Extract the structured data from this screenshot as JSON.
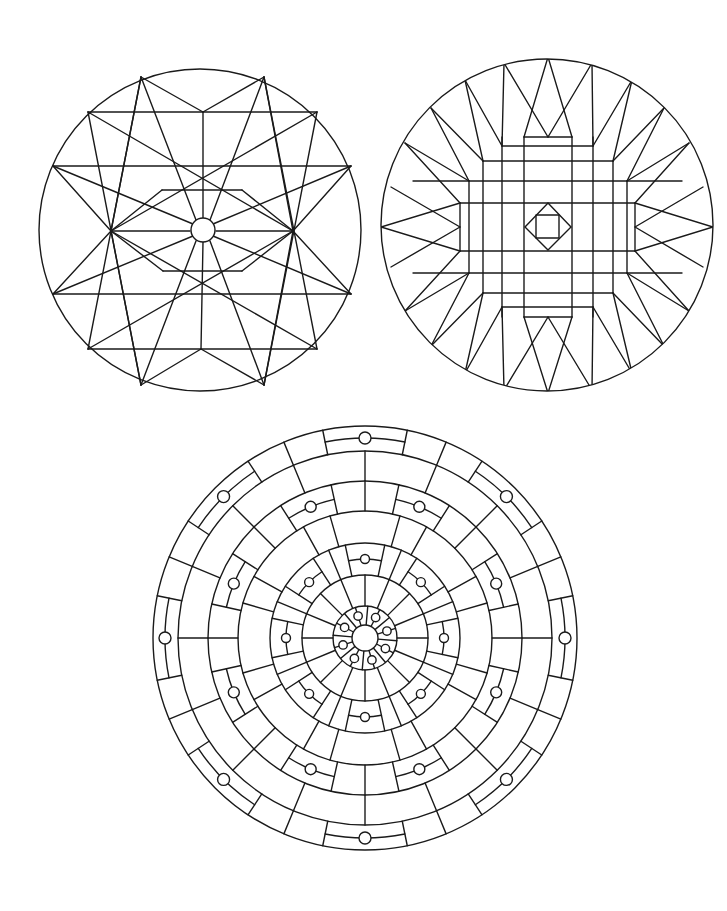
{
  "page": {
    "background": "#ffffff",
    "stroke_color": "#1a1a1a",
    "width": 727,
    "height": 911
  },
  "mandala_star": {
    "label": "star-mandala",
    "outer_circle": {
      "cx": 200,
      "cy": 230,
      "r": 161
    },
    "center_circle": {
      "cx": 203,
      "cy": 230,
      "r": 12
    },
    "lines": [
      [
        88,
        112,
        317,
        112
      ],
      [
        53,
        166,
        351,
        166
      ],
      [
        162,
        190,
        242,
        190
      ],
      [
        111,
        231,
        190,
        231
      ],
      [
        216,
        231,
        293,
        231
      ],
      [
        163,
        271,
        242,
        271
      ],
      [
        53,
        294,
        351,
        294
      ],
      [
        88,
        349,
        317,
        349
      ],
      [
        141,
        77,
        203,
        112
      ],
      [
        264,
        77,
        203,
        112
      ],
      [
        141,
        385,
        201,
        349
      ],
      [
        264,
        385,
        201,
        349
      ],
      [
        203,
        112,
        203,
        218
      ],
      [
        203,
        242,
        201,
        349
      ],
      [
        141,
        77,
        111,
        231
      ],
      [
        141,
        77,
        196,
        220
      ],
      [
        264,
        77,
        293,
        231
      ],
      [
        264,
        77,
        210,
        220
      ],
      [
        88,
        112,
        293,
        231
      ],
      [
        317,
        112,
        111,
        231
      ],
      [
        53,
        166,
        193,
        224
      ],
      [
        351,
        166,
        213,
        224
      ],
      [
        53,
        294,
        193,
        236
      ],
      [
        351,
        294,
        213,
        236
      ],
      [
        88,
        349,
        293,
        231
      ],
      [
        317,
        349,
        111,
        231
      ],
      [
        141,
        385,
        111,
        231
      ],
      [
        141,
        385,
        196,
        241
      ],
      [
        264,
        385,
        293,
        231
      ],
      [
        264,
        385,
        210,
        241
      ],
      [
        53,
        166,
        111,
        231
      ],
      [
        53,
        294,
        111,
        231
      ],
      [
        351,
        166,
        293,
        231
      ],
      [
        351,
        294,
        293,
        231
      ],
      [
        88,
        112,
        141,
        385
      ],
      [
        317,
        112,
        264,
        385
      ],
      [
        88,
        349,
        141,
        77
      ],
      [
        317,
        349,
        264,
        77
      ],
      [
        162,
        190,
        111,
        231
      ],
      [
        242,
        190,
        293,
        231
      ],
      [
        163,
        271,
        111,
        231
      ],
      [
        242,
        271,
        293,
        231
      ]
    ]
  },
  "mandala_grid": {
    "label": "grid-mandala",
    "outer_circle": {
      "cx": 547,
      "cy": 225,
      "r": 166
    },
    "diamond": [
      [
        548,
        203
      ],
      [
        571,
        227
      ],
      [
        548,
        250
      ],
      [
        525,
        227
      ]
    ],
    "inner_square": {
      "x": 536,
      "y": 215,
      "w": 23,
      "h": 23
    },
    "lines": [
      [
        502,
        137,
        502,
        317
      ],
      [
        524,
        137,
        524,
        317
      ],
      [
        572,
        137,
        572,
        317
      ],
      [
        593,
        137,
        593,
        317
      ],
      [
        483,
        161,
        483,
        293
      ],
      [
        613,
        161,
        613,
        293
      ],
      [
        469,
        181,
        469,
        273
      ],
      [
        627,
        181,
        627,
        273
      ],
      [
        460,
        203,
        460,
        251
      ],
      [
        635,
        203,
        635,
        251
      ],
      [
        524,
        137,
        572,
        137
      ],
      [
        502,
        146,
        593,
        146
      ],
      [
        483,
        161,
        613,
        161
      ],
      [
        413,
        181,
        682,
        181
      ],
      [
        460,
        203,
        635,
        203
      ],
      [
        460,
        251,
        635,
        251
      ],
      [
        413,
        273,
        682,
        273
      ],
      [
        483,
        293,
        613,
        293
      ],
      [
        502,
        307,
        593,
        307
      ],
      [
        524,
        317,
        572,
        317
      ],
      [
        548,
        57,
        524,
        137
      ],
      [
        548,
        57,
        572,
        137
      ],
      [
        504,
        63,
        548,
        137
      ],
      [
        592,
        63,
        548,
        137
      ],
      [
        504,
        63,
        502,
        146
      ],
      [
        592,
        63,
        593,
        146
      ],
      [
        465,
        80,
        502,
        146
      ],
      [
        632,
        80,
        593,
        146
      ],
      [
        465,
        80,
        483,
        161
      ],
      [
        632,
        80,
        613,
        161
      ],
      [
        431,
        108,
        483,
        161
      ],
      [
        664,
        108,
        613,
        161
      ],
      [
        431,
        108,
        469,
        181
      ],
      [
        664,
        108,
        627,
        181
      ],
      [
        405,
        143,
        469,
        181
      ],
      [
        689,
        143,
        627,
        181
      ],
      [
        405,
        143,
        460,
        203
      ],
      [
        689,
        143,
        635,
        203
      ],
      [
        381,
        227,
        460,
        203
      ],
      [
        713,
        227,
        635,
        203
      ],
      [
        381,
        227,
        460,
        251
      ],
      [
        713,
        227,
        635,
        251
      ],
      [
        391,
        187,
        460,
        227
      ],
      [
        703,
        187,
        635,
        227
      ],
      [
        391,
        267,
        460,
        227
      ],
      [
        703,
        267,
        635,
        227
      ],
      [
        405,
        311,
        460,
        251
      ],
      [
        689,
        311,
        635,
        251
      ],
      [
        405,
        311,
        469,
        273
      ],
      [
        689,
        311,
        627,
        273
      ],
      [
        431,
        346,
        469,
        273
      ],
      [
        664,
        346,
        627,
        273
      ],
      [
        431,
        346,
        483,
        293
      ],
      [
        664,
        346,
        613,
        293
      ],
      [
        465,
        373,
        483,
        293
      ],
      [
        632,
        373,
        613,
        293
      ],
      [
        465,
        373,
        502,
        307
      ],
      [
        632,
        373,
        593,
        307
      ],
      [
        504,
        390,
        502,
        307
      ],
      [
        592,
        390,
        593,
        307
      ],
      [
        504,
        390,
        548,
        317
      ],
      [
        592,
        390,
        548,
        317
      ],
      [
        548,
        393,
        524,
        317
      ],
      [
        548,
        393,
        572,
        317
      ]
    ]
  },
  "mandala_rings": {
    "label": "ring-mandala",
    "cx": 365,
    "cy": 638,
    "rings": [
      212,
      187,
      157,
      127,
      95,
      63,
      32
    ],
    "center_circle_r": 13,
    "bands": [
      {
        "name": "outer-band",
        "r_in": 187,
        "r_out": 212,
        "dividers_deg": [
          22.5,
          67.5,
          112.5,
          157.5,
          202.5,
          247.5,
          292.5,
          337.5
        ],
        "medallions": {
          "angles_deg": [
            0,
            45,
            90,
            135,
            180,
            225,
            270,
            315
          ],
          "half_width_deg": 11.5,
          "mid_r": 200,
          "dot_r": 6
        }
      },
      {
        "name": "band-2",
        "r_in": 157,
        "r_out": 187,
        "dividers_deg": [
          0,
          22.5,
          45,
          67.5,
          90,
          112.5,
          135,
          157.5,
          180,
          202.5,
          225,
          247.5,
          270,
          292.5,
          315,
          337.5
        ],
        "medallions": null
      },
      {
        "name": "band-3",
        "r_in": 127,
        "r_out": 157,
        "dividers_deg": [
          0,
          45,
          90,
          135,
          180,
          225,
          270,
          315
        ],
        "medallions": {
          "angles_deg": [
            22.5,
            67.5,
            112.5,
            157.5,
            202.5,
            247.5,
            292.5,
            337.5
          ],
          "half_width_deg": 10,
          "mid_r": 142,
          "dot_r": 5.5
        }
      },
      {
        "name": "band-4",
        "r_in": 95,
        "r_out": 127,
        "dividers_deg": [
          16,
          29,
          61,
          74,
          106,
          119,
          151,
          164,
          196,
          209,
          241,
          254,
          286,
          299,
          331,
          344
        ],
        "medallions": null
      },
      {
        "name": "band-5",
        "r_in": 63,
        "r_out": 95,
        "dividers_deg": [
          22.5,
          67.5,
          112.5,
          157.5,
          202.5,
          247.5,
          292.5,
          337.5
        ],
        "medallions": {
          "angles_deg": [
            0,
            45,
            90,
            135,
            180,
            225,
            270,
            315
          ],
          "half_width_deg": 12,
          "mid_r": 79,
          "dot_r": 4.5
        }
      },
      {
        "name": "band-6",
        "r_in": 32,
        "r_out": 63,
        "dividers_deg": [
          0,
          22.5,
          45,
          67.5,
          90,
          112.5,
          135,
          157.5,
          180,
          202.5,
          225,
          247.5,
          270,
          292.5,
          315,
          337.5
        ],
        "medallions": null
      },
      {
        "name": "band-7",
        "r_in": 13,
        "r_out": 32,
        "dividers_deg": [
          5,
          50,
          95,
          140,
          185,
          230,
          275,
          320
        ],
        "medallions": null,
        "dots": {
          "angles_deg": [
            27.5,
            72.5,
            117.5,
            162.5,
            207.5,
            252.5,
            297.5,
            342.5
          ],
          "r": 23,
          "dot_r": 4.2
        }
      }
    ]
  }
}
